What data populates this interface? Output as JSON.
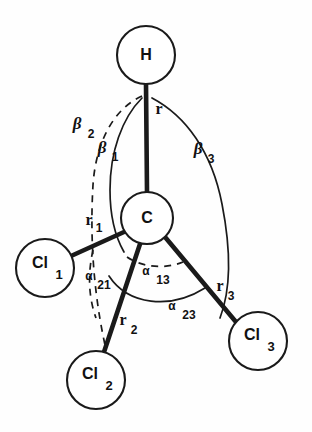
{
  "figure": {
    "name": "chcl3-molecular-geometry-diagram",
    "background_color": "#fefefe",
    "stroke_color": "#1a1a1a",
    "width": 312,
    "height": 432
  },
  "atoms": [
    {
      "id": "H",
      "label": "H",
      "subscript": "",
      "cx": 146,
      "cy": 55,
      "r": 29
    },
    {
      "id": "C",
      "label": "C",
      "subscript": "",
      "cx": 147,
      "cy": 218,
      "r": 26
    },
    {
      "id": "Cl1",
      "label": "Cl",
      "subscript": "1",
      "cx": 45,
      "cy": 268,
      "r": 29
    },
    {
      "id": "Cl2",
      "label": "Cl",
      "subscript": "2",
      "cx": 96,
      "cy": 380,
      "r": 29
    },
    {
      "id": "Cl3",
      "label": "Cl",
      "subscript": "3",
      "cx": 258,
      "cy": 341,
      "r": 29
    }
  ],
  "bonds": [
    {
      "id": "bond-r",
      "from": "C",
      "to": "H",
      "label": "r",
      "subscript": "",
      "label_x": 159,
      "label_y": 110
    },
    {
      "id": "bond-r1",
      "from": "C",
      "to": "Cl1",
      "label": "r",
      "subscript": "1",
      "label_x": 93,
      "label_y": 222
    },
    {
      "id": "bond-r2",
      "from": "C",
      "to": "Cl2",
      "label": "r",
      "subscript": "2",
      "label_x": 127,
      "label_y": 325
    },
    {
      "id": "bond-r3",
      "from": "C",
      "to": "Cl3",
      "label": "r",
      "subscript": "3",
      "label_x": 224,
      "label_y": 291
    }
  ],
  "angles": [
    {
      "id": "beta1",
      "symbol": "β",
      "subscript": "1",
      "style": "solid",
      "label_x": 107,
      "label_y": 152
    },
    {
      "id": "beta2",
      "symbol": "β",
      "subscript": "2",
      "style": "dashed",
      "label_x": 83,
      "label_y": 128
    },
    {
      "id": "beta3",
      "symbol": "β",
      "subscript": "3",
      "style": "solid",
      "label_x": 203,
      "label_y": 153
    },
    {
      "id": "alpha13",
      "symbol": "α",
      "subscript": "13",
      "style": "dashed",
      "label_x": 154,
      "label_y": 276
    },
    {
      "id": "alpha21",
      "symbol": "α",
      "subscript": "21",
      "style": "dashed",
      "label_x": 96,
      "label_y": 281
    },
    {
      "id": "alpha23",
      "symbol": "α",
      "subscript": "23",
      "style": "solid",
      "label_x": 180,
      "label_y": 311
    }
  ]
}
